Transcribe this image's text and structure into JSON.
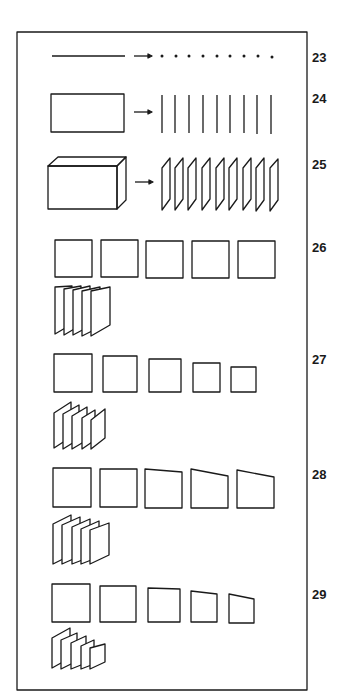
{
  "figure": {
    "stroke_color": "#1a1a1a",
    "background": "#ffffff",
    "rows": [
      {
        "number": "23",
        "description": "A line decomposed into a row of points",
        "left_item": "line",
        "arrow": true,
        "right_items": {
          "shape": "dot",
          "count": 9
        }
      },
      {
        "number": "24",
        "description": "A rectangle decomposed into a row of vertical lines",
        "left_item": "rectangle",
        "arrow": true,
        "right_items": {
          "shape": "vertical-line",
          "count": 9
        }
      },
      {
        "number": "25",
        "description": "A box (solid) decomposed into a row of slanted planes",
        "left_item": "box",
        "arrow": true,
        "right_items": {
          "shape": "parallelogram",
          "count": 9
        }
      },
      {
        "number": "26",
        "description": "Five equal squares; overlapping planes of equal size",
        "squares": {
          "count": 5,
          "variation": "equal"
        },
        "stack": {
          "count": 5,
          "variation": "equal"
        }
      },
      {
        "number": "27",
        "description": "Five squares diminishing in size; overlapping planes diminishing",
        "squares": {
          "count": 5,
          "variation": "diminishing"
        },
        "stack": {
          "count": 5,
          "variation": "diminishing"
        }
      },
      {
        "number": "28",
        "description": "Five squares with progressively sloped tops; overlapping planes",
        "squares": {
          "count": 5,
          "variation": "skewing"
        },
        "stack": {
          "count": 5,
          "variation": "skewing"
        }
      },
      {
        "number": "29",
        "description": "Five squares diminishing and sloping; overlapping planes",
        "squares": {
          "count": 5,
          "variation": "diminishing-and-skewing"
        },
        "stack": {
          "count": 5,
          "variation": "diminishing-and-skewing"
        }
      }
    ]
  }
}
